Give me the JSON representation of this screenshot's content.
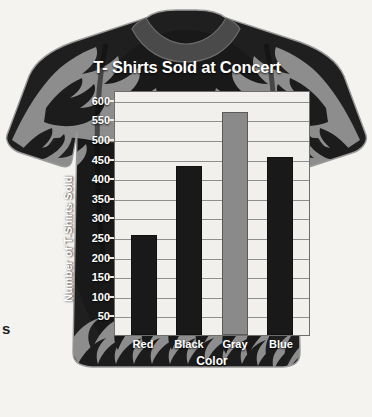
{
  "margin_text": "s",
  "garment": {
    "name": "t-shirt",
    "body_color": "#1d1c1c",
    "flame_color": "#8b8b8b",
    "collar_color": "#444444",
    "page_background": "#f4f3f0"
  },
  "chart_data": {
    "type": "bar",
    "title": "T- Shirts Sold at Concert",
    "xlabel": "Color",
    "ylabel": "Number of T-Shirts Sold",
    "categories": [
      "Red",
      "Black",
      "Gray",
      "Blue"
    ],
    "values": [
      255,
      430,
      570,
      455
    ],
    "bar_colors": [
      "#191919",
      "#191919",
      "#8a8a8a",
      "#191919"
    ],
    "ylim": [
      0,
      625
    ],
    "yticks": [
      50,
      100,
      150,
      200,
      250,
      300,
      350,
      400,
      450,
      500,
      550,
      600
    ],
    "ytick_labels": [
      "50",
      "100",
      "150",
      "200",
      "250",
      "300",
      "350",
      "400",
      "450",
      "500",
      "550",
      "600"
    ],
    "grid": true,
    "legend": false,
    "plot_background": "#f1f0ec",
    "gridline_color": "#8e8e8e",
    "text_color": "#ffffff"
  }
}
